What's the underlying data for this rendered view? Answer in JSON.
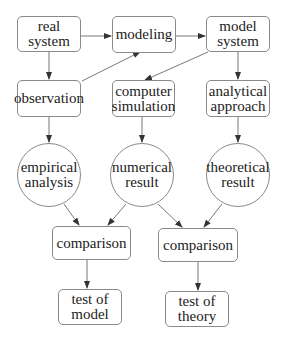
{
  "diagram": {
    "type": "flowchart",
    "nodes": {
      "real_system": {
        "label": "real\nsystem",
        "shape": "rounded-box"
      },
      "modeling": {
        "label": "modeling",
        "shape": "rounded-box"
      },
      "model_system": {
        "label": "model\nsystem",
        "shape": "rounded-box"
      },
      "observation": {
        "label": "observation",
        "shape": "rounded-box"
      },
      "computer_simulation": {
        "label": "computer\nsimulation",
        "shape": "rounded-box"
      },
      "analytical_approach": {
        "label": "analytical\napproach",
        "shape": "rounded-box"
      },
      "empirical_analysis": {
        "label": "empirical\nanalysis",
        "shape": "circle"
      },
      "numerical_result": {
        "label": "numerical\nresult",
        "shape": "circle"
      },
      "theoretical_result": {
        "label": "theoretical\nresult",
        "shape": "circle"
      },
      "comparison_left": {
        "label": "comparison",
        "shape": "rounded-box"
      },
      "comparison_right": {
        "label": "comparison",
        "shape": "rounded-box"
      },
      "test_of_model": {
        "label": "test of\nmodel",
        "shape": "rounded-box"
      },
      "test_of_theory": {
        "label": "test of\ntheory",
        "shape": "rounded-box"
      }
    },
    "edges": [
      {
        "from": "real_system",
        "to": "modeling"
      },
      {
        "from": "modeling",
        "to": "model_system"
      },
      {
        "from": "real_system",
        "to": "observation"
      },
      {
        "from": "observation",
        "to": "modeling"
      },
      {
        "from": "model_system",
        "to": "computer_simulation"
      },
      {
        "from": "model_system",
        "to": "analytical_approach"
      },
      {
        "from": "observation",
        "to": "empirical_analysis"
      },
      {
        "from": "computer_simulation",
        "to": "numerical_result"
      },
      {
        "from": "analytical_approach",
        "to": "theoretical_result"
      },
      {
        "from": "empirical_analysis",
        "to": "comparison_left"
      },
      {
        "from": "numerical_result",
        "to": "comparison_left"
      },
      {
        "from": "numerical_result",
        "to": "comparison_right"
      },
      {
        "from": "theoretical_result",
        "to": "comparison_right"
      },
      {
        "from": "comparison_left",
        "to": "test_of_model"
      },
      {
        "from": "comparison_right",
        "to": "test_of_theory"
      }
    ],
    "colors": {
      "stroke": "#8a8a8a",
      "arrow": "#333333",
      "text": "#222222"
    }
  }
}
